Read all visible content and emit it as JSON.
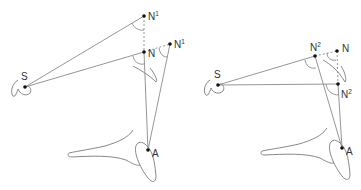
{
  "diagrams": {
    "left": {
      "points": {
        "S": {
          "label": "S",
          "x": 25,
          "y": 87
        },
        "N1_top": {
          "label": "N",
          "sup": "1",
          "x": 144,
          "y": 16
        },
        "N": {
          "label": "N",
          "x": 144,
          "y": 52
        },
        "N1_right": {
          "label": "N",
          "sup": "1",
          "x": 170,
          "y": 44
        },
        "A": {
          "label": "A",
          "x": 148,
          "y": 150
        }
      }
    },
    "right": {
      "points": {
        "S": {
          "label": "S",
          "x": 218,
          "y": 85
        },
        "N2_top": {
          "label": "N",
          "sup": "2",
          "x": 315,
          "y": 56
        },
        "N": {
          "label": "N",
          "x": 337,
          "y": 51
        },
        "N2_lower": {
          "label": "N",
          "sup": "2",
          "x": 338,
          "y": 84
        },
        "A": {
          "label": "A",
          "x": 342,
          "y": 148
        }
      }
    }
  },
  "colors": {
    "line": "#8a8a8a",
    "point": "#111111",
    "label": "#333333"
  }
}
